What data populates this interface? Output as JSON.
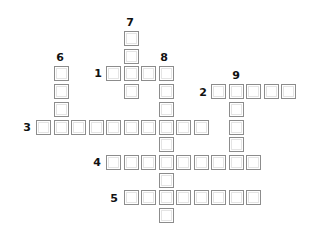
{
  "puzzle": {
    "type": "crossword",
    "cell_size": 15,
    "origin": {
      "x": 36,
      "y": 31
    },
    "pitch": {
      "x": 17.5,
      "y": 17.7
    },
    "colors": {
      "border": "#8c8c8c",
      "fill": "#ffffff",
      "number": "#111111"
    },
    "entries": [
      {
        "number": "1",
        "direction": "across",
        "col": 4,
        "row": 2,
        "length": 4,
        "label_pos": {
          "x": 92,
          "y": 68
        }
      },
      {
        "number": "2",
        "direction": "across",
        "col": 10,
        "row": 3,
        "length": 5,
        "label_pos": {
          "x": 197,
          "y": 87
        }
      },
      {
        "number": "3",
        "direction": "across",
        "col": 0,
        "row": 5,
        "length": 10,
        "label_pos": {
          "x": 21,
          "y": 122
        }
      },
      {
        "number": "4",
        "direction": "across",
        "col": 4,
        "row": 7,
        "length": 9,
        "label_pos": {
          "x": 91,
          "y": 157
        }
      },
      {
        "number": "5",
        "direction": "across",
        "col": 5,
        "row": 9,
        "length": 8,
        "label_pos": {
          "x": 108,
          "y": 193
        }
      },
      {
        "number": "6",
        "direction": "down",
        "col": 1,
        "row": 2,
        "length": 4,
        "label_pos": {
          "x": 54,
          "y": 52
        }
      },
      {
        "number": "7",
        "direction": "down",
        "col": 5,
        "row": 0,
        "length": 4,
        "label_pos": {
          "x": 124,
          "y": 17
        }
      },
      {
        "number": "8",
        "direction": "down",
        "col": 7,
        "row": 2,
        "length": 9,
        "label_pos": {
          "x": 158,
          "y": 52
        }
      },
      {
        "number": "9",
        "direction": "down",
        "col": 11,
        "row": 3,
        "length": 5,
        "label_pos": {
          "x": 230,
          "y": 70
        }
      }
    ]
  }
}
